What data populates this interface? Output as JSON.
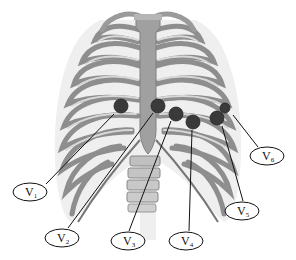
{
  "diagram": {
    "colors": {
      "bone_dark": "#7a7a7a",
      "bone_mid": "#a9a9a9",
      "bone_light": "#d6d6d6",
      "sternum": "#9a9a9a",
      "electrode": "#3a3a3a",
      "line": "#111111"
    },
    "electrodes": [
      {
        "id": "V1",
        "label": "V",
        "sub": "1",
        "cx": 121,
        "cy": 106,
        "r": 7,
        "label_cx": 30,
        "label_cy": 192,
        "line": [
          46,
          184,
          114,
          114
        ]
      },
      {
        "id": "V2",
        "label": "V",
        "sub": "2",
        "cx": 158,
        "cy": 106,
        "r": 7,
        "label_cx": 62,
        "label_cy": 238,
        "line": [
          68,
          228,
          153,
          113
        ]
      },
      {
        "id": "V3",
        "label": "V",
        "sub": "3",
        "cx": 176,
        "cy": 114,
        "r": 7,
        "label_cx": 128,
        "label_cy": 241,
        "line": [
          129,
          231,
          171,
          121
        ]
      },
      {
        "id": "V4",
        "label": "V",
        "sub": "4",
        "cx": 193,
        "cy": 122,
        "r": 7,
        "label_cx": 186,
        "label_cy": 241,
        "line": [
          189,
          231,
          192,
          130
        ]
      },
      {
        "id": "V5",
        "label": "V",
        "sub": "5",
        "cx": 217,
        "cy": 118,
        "r": 7,
        "label_cx": 242,
        "label_cy": 211,
        "line": [
          243,
          201,
          222,
          126
        ]
      },
      {
        "id": "V6",
        "label": "V",
        "sub": "6",
        "cx": 225,
        "cy": 108,
        "r": 5,
        "label_cx": 267,
        "label_cy": 156,
        "line": [
          258,
          147,
          233,
          115
        ]
      }
    ]
  }
}
